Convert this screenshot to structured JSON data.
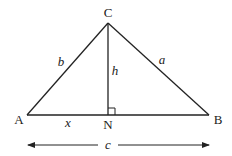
{
  "diagram": {
    "type": "triangle-altitude",
    "vertices": {
      "A": {
        "label": "A",
        "x": 27,
        "y": 115
      },
      "B": {
        "label": "B",
        "x": 209,
        "y": 115
      },
      "C": {
        "label": "C",
        "x": 108,
        "y": 23
      },
      "N": {
        "label": "N",
        "x": 108,
        "y": 115
      }
    },
    "sides": {
      "b": "b",
      "a": "a",
      "h": "h",
      "x": "x",
      "c": "c"
    },
    "right_angle_at": "N",
    "colors": {
      "stroke": "#222222",
      "background": "#ffffff"
    }
  }
}
